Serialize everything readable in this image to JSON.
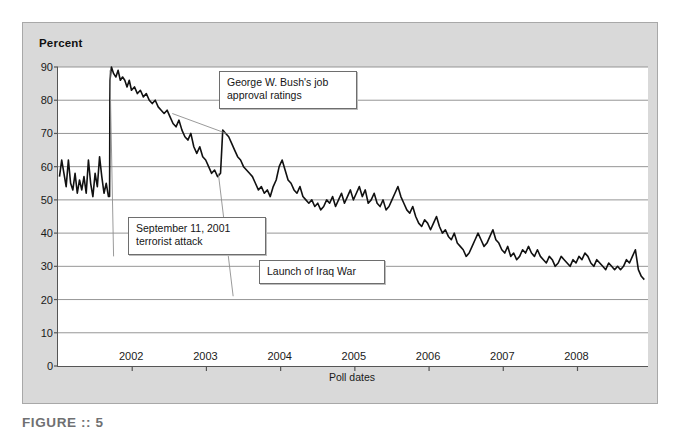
{
  "figure": {
    "caption": "FIGURE :: 5",
    "panel_bg": "#d9d9d9",
    "plot_bg": "#ffffff",
    "axis_color": "#555555",
    "grid_color": "#8a8a8a",
    "series_color": "#111111",
    "leader_color": "#8f8f8f"
  },
  "axis": {
    "y_title": "Percent",
    "x_title": "Poll dates"
  },
  "annotations": [
    {
      "id": "bush",
      "name": "bush-approval-callout",
      "text": "George W. Bush's job\napproval ratings"
    },
    {
      "id": "sept",
      "name": "sept11-callout",
      "text": "September 11, 2001\nterrorist attack"
    },
    {
      "id": "iraq",
      "name": "iraq-war-callout",
      "text": "Launch of Iraq War"
    }
  ],
  "ghost_text": [
    {
      "x": 178,
      "y": 33,
      "text": "of presidential approval ratings, such as whether the president is responsible for"
    },
    {
      "x": 178,
      "y": 45,
      "text": "war casualties. Ex post facto, many Americans were stating that these ratings were"
    },
    {
      "x": 330,
      "y": 58,
      "text": "a function of the war on terror"
    },
    {
      "x": 350,
      "y": 70,
      "text": "and the state of the economy."
    },
    {
      "x": 300,
      "y": 88,
      "text": "questions about presidential performance"
    },
    {
      "x": 420,
      "y": 104,
      "text": "in times of crisis and recovery"
    },
    {
      "x": 200,
      "y": 276,
      "text": "the president and the public and the relationship between"
    },
    {
      "x": 215,
      "y": 292,
      "text": "approval ratings and major political events over time"
    },
    {
      "x": 412,
      "y": 308,
      "text": "rally events and their decay"
    },
    {
      "x": 198,
      "y": 372,
      "text": "shown in approval numbers over time and the events that may explain them"
    },
    {
      "x": 430,
      "y": 384,
      "text": "(Source: Drew et al., 2008)"
    }
  ],
  "chart_data": {
    "type": "line",
    "xlabel": "Poll dates",
    "ylabel": "Percent",
    "ylim": [
      0,
      90
    ],
    "yticks": [
      0,
      10,
      20,
      30,
      40,
      50,
      60,
      70,
      80,
      90
    ],
    "xlim": [
      2001.0,
      2008.95
    ],
    "xticks": [
      2002,
      2003,
      2004,
      2005,
      2006,
      2007,
      2008
    ],
    "xtick_labels": [
      "2002",
      "2003",
      "2004",
      "2005",
      "2006",
      "2007",
      "2008"
    ],
    "grid": "horizontal",
    "legend": "none",
    "events": [
      {
        "label": "September 11, 2001 terrorist attack",
        "x": 2001.7,
        "y_before": 51,
        "y_after": 90
      },
      {
        "label": "Launch of Iraq War",
        "x": 2003.22,
        "y": 71
      }
    ],
    "x": [
      2001.02,
      2001.05,
      2001.08,
      2001.11,
      2001.14,
      2001.17,
      2001.2,
      2001.23,
      2001.26,
      2001.29,
      2001.32,
      2001.35,
      2001.38,
      2001.41,
      2001.44,
      2001.47,
      2001.5,
      2001.53,
      2001.56,
      2001.59,
      2001.62,
      2001.65,
      2001.68,
      2001.695,
      2001.7,
      2001.72,
      2001.75,
      2001.78,
      2001.81,
      2001.84,
      2001.87,
      2001.9,
      2001.93,
      2001.96,
      2001.99,
      2002.03,
      2002.07,
      2002.11,
      2002.15,
      2002.19,
      2002.23,
      2002.27,
      2002.31,
      2002.35,
      2002.39,
      2002.43,
      2002.47,
      2002.51,
      2002.55,
      2002.59,
      2002.63,
      2002.67,
      2002.71,
      2002.75,
      2002.79,
      2002.83,
      2002.87,
      2002.91,
      2002.95,
      2002.99,
      2003.03,
      2003.07,
      2003.11,
      2003.15,
      2003.19,
      2003.22,
      2003.26,
      2003.3,
      2003.34,
      2003.38,
      2003.42,
      2003.46,
      2003.5,
      2003.54,
      2003.58,
      2003.62,
      2003.66,
      2003.7,
      2003.74,
      2003.78,
      2003.82,
      2003.86,
      2003.9,
      2003.94,
      2003.98,
      2004.02,
      2004.06,
      2004.1,
      2004.14,
      2004.18,
      2004.22,
      2004.26,
      2004.3,
      2004.34,
      2004.38,
      2004.42,
      2004.46,
      2004.5,
      2004.54,
      2004.58,
      2004.62,
      2004.66,
      2004.7,
      2004.74,
      2004.78,
      2004.82,
      2004.86,
      2004.9,
      2004.94,
      2004.98,
      2005.02,
      2005.06,
      2005.1,
      2005.14,
      2005.18,
      2005.22,
      2005.26,
      2005.3,
      2005.34,
      2005.38,
      2005.42,
      2005.46,
      2005.5,
      2005.54,
      2005.58,
      2005.62,
      2005.66,
      2005.7,
      2005.74,
      2005.78,
      2005.82,
      2005.86,
      2005.9,
      2005.94,
      2005.98,
      2006.02,
      2006.06,
      2006.1,
      2006.14,
      2006.18,
      2006.22,
      2006.26,
      2006.3,
      2006.34,
      2006.38,
      2006.42,
      2006.46,
      2006.5,
      2006.54,
      2006.58,
      2006.62,
      2006.66,
      2006.7,
      2006.74,
      2006.78,
      2006.82,
      2006.86,
      2006.9,
      2006.94,
      2006.98,
      2007.02,
      2007.06,
      2007.1,
      2007.14,
      2007.18,
      2007.22,
      2007.26,
      2007.3,
      2007.34,
      2007.38,
      2007.42,
      2007.46,
      2007.5,
      2007.54,
      2007.58,
      2007.62,
      2007.66,
      2007.7,
      2007.74,
      2007.78,
      2007.82,
      2007.86,
      2007.9,
      2007.94,
      2007.98,
      2008.02,
      2008.06,
      2008.1,
      2008.14,
      2008.18,
      2008.22,
      2008.26,
      2008.3,
      2008.34,
      2008.38,
      2008.42,
      2008.46,
      2008.5,
      2008.54,
      2008.58,
      2008.62,
      2008.66,
      2008.7,
      2008.74,
      2008.78,
      2008.82,
      2008.86,
      2008.9
    ],
    "y": [
      57,
      62,
      58,
      54,
      62,
      55,
      53,
      58,
      52,
      56,
      53,
      57,
      52,
      62,
      55,
      51,
      58,
      54,
      63,
      57,
      52,
      55,
      51,
      51,
      86,
      90,
      88,
      87,
      89,
      86,
      87,
      86,
      84,
      86,
      83,
      84,
      82,
      83,
      81,
      82,
      80,
      79,
      80,
      78,
      77,
      76,
      77,
      75,
      73,
      72,
      74,
      71,
      69,
      68,
      70,
      66,
      64,
      66,
      63,
      62,
      60,
      58,
      59,
      57,
      58,
      71,
      70,
      69,
      67,
      65,
      63,
      62,
      60,
      59,
      58,
      57,
      55,
      53,
      54,
      52,
      53,
      51,
      54,
      56,
      60,
      62,
      59,
      56,
      55,
      53,
      52,
      54,
      51,
      50,
      49,
      50,
      48,
      49,
      47,
      48,
      50,
      49,
      51,
      48,
      50,
      52,
      49,
      51,
      53,
      50,
      52,
      54,
      51,
      53,
      49,
      50,
      52,
      49,
      48,
      50,
      47,
      48,
      50,
      52,
      54,
      51,
      49,
      47,
      46,
      48,
      45,
      43,
      42,
      44,
      43,
      41,
      43,
      45,
      42,
      40,
      41,
      39,
      38,
      40,
      37,
      36,
      35,
      33,
      34,
      36,
      38,
      40,
      38,
      36,
      37,
      39,
      41,
      38,
      37,
      35,
      34,
      36,
      33,
      34,
      32,
      33,
      35,
      34,
      36,
      34,
      33,
      35,
      33,
      32,
      31,
      33,
      32,
      30,
      31,
      33,
      32,
      31,
      30,
      32,
      31,
      33,
      32,
      34,
      33,
      31,
      30,
      32,
      31,
      30,
      29,
      31,
      30,
      29,
      30,
      29,
      30,
      32,
      31,
      33,
      35,
      29,
      27,
      26
    ]
  }
}
